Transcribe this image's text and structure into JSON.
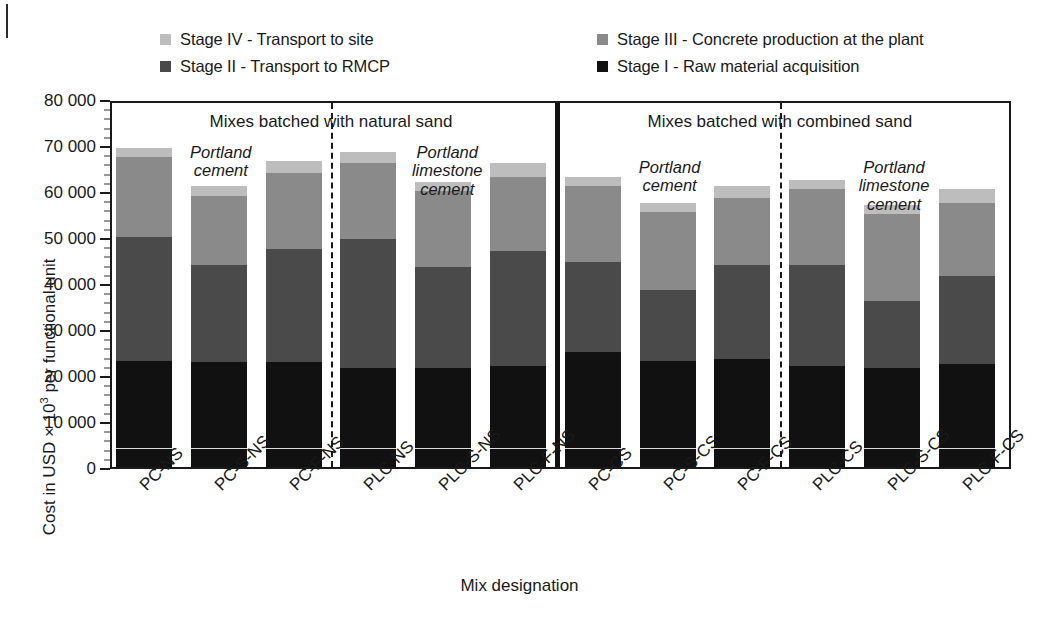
{
  "axis": {
    "y_title_prefix": "Cost in USD × 10",
    "y_title_sup": "3",
    "y_title_suffix": " per functional unit",
    "x_title": "Mix designation",
    "y_ticks": [
      "0",
      "10 000",
      "20 000",
      "30 000",
      "40 000",
      "50 000",
      "60 000",
      "70 000",
      "80 000"
    ]
  },
  "legend": {
    "items": [
      {
        "label": "Stage IV - Transport to site",
        "color": "#bdbdbd",
        "row": 0,
        "col": 0
      },
      {
        "label": "Stage III - Concrete production at the plant",
        "color": "#8a8a8a",
        "row": 0,
        "col": 1
      },
      {
        "label": "Stage II - Transport to RMCP",
        "color": "#4a4a4a",
        "row": 1,
        "col": 0
      },
      {
        "label": "Stage I - Raw material acquisition",
        "color": "#111111",
        "row": 1,
        "col": 1
      }
    ]
  },
  "annotations": {
    "panels": [
      {
        "text": "Mixes batched with natural sand"
      },
      {
        "text": "Mixes batched with combined sand"
      }
    ],
    "groups": [
      {
        "text": "Portland\ncement"
      },
      {
        "text": "Portland\nlimestone\ncement"
      },
      {
        "text": "Portland\ncement"
      },
      {
        "text": "Portland\nlimestone\ncement"
      }
    ]
  },
  "chart_data": {
    "type": "bar",
    "title": "",
    "xlabel": "Mix designation",
    "ylabel": "Cost in USD × 10³ per functional unit",
    "ylim": [
      0,
      80000
    ],
    "ytick_step": 10000,
    "yminor_step": 2000,
    "grid": false,
    "stacked": true,
    "legend_position": "top",
    "categories": [
      "PC-NS",
      "PC-S-NS",
      "PC-F-NS",
      "PLC-NS",
      "PLC-S-NS",
      "PLC-F-NS",
      "PC-CS",
      "PC-S-CS",
      "PC-F-CS",
      "PLC-CS",
      "PLC-S-CS",
      "PLC-F-CS"
    ],
    "series": [
      {
        "name": "Stage I - Raw material acquisition",
        "color": "#111111",
        "values": [
          23000,
          22800,
          22800,
          21500,
          21500,
          22000,
          25000,
          23000,
          23500,
          22000,
          21500,
          22500
        ]
      },
      {
        "name": "Stage II - Transport to RMCP",
        "color": "#4a4a4a",
        "values": [
          27000,
          21200,
          24700,
          28000,
          22000,
          25000,
          19500,
          15500,
          20500,
          22000,
          14500,
          19000
        ]
      },
      {
        "name": "Stage III - Concrete production at the plant",
        "color": "#8a8a8a",
        "values": [
          17300,
          15000,
          16500,
          16500,
          16500,
          16000,
          16500,
          17000,
          14500,
          16500,
          19000,
          16000
        ]
      },
      {
        "name": "Stage IV - Transport to site",
        "color": "#bdbdbd",
        "values": [
          2000,
          2000,
          2500,
          2500,
          2000,
          3000,
          2000,
          2000,
          2500,
          2000,
          2000,
          3000
        ]
      }
    ],
    "totals": [
      69300,
      61000,
      66500,
      68500,
      62000,
      66000,
      63000,
      57500,
      61000,
      62500,
      57000,
      60500
    ]
  }
}
